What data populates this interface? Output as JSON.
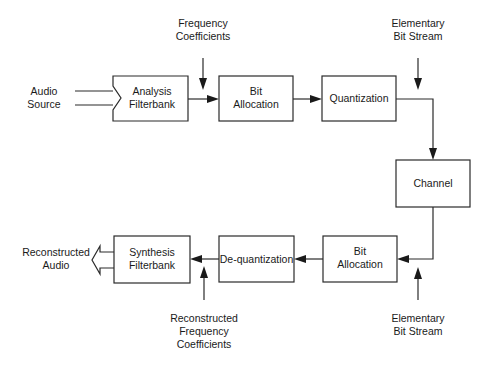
{
  "diagram": {
    "type": "block-diagram",
    "colors": {
      "stroke": "#2a2a2a",
      "text": "#1a1a1a",
      "background": "#ffffff"
    },
    "input_label": [
      "Audio",
      "Source"
    ],
    "output_label": [
      "Reconstructed",
      "Audio"
    ],
    "top_row": {
      "analysis": [
        "Analysis",
        "Filterbank"
      ],
      "bit_allocation": [
        "Bit",
        "Allocation"
      ],
      "quantization": "Quantization"
    },
    "channel": "Channel",
    "bottom_row": {
      "bit_allocation": [
        "Bit",
        "Allocation"
      ],
      "dequantization": "De-quantization",
      "synthesis": [
        "Synthesis",
        "Filterbank"
      ]
    },
    "side_inputs": {
      "frequency_coefficients": [
        "Frequency",
        "Coefficients"
      ],
      "elementary_bit_stream_top": [
        "Elementary",
        "Bit Stream"
      ],
      "elementary_bit_stream_bottom": [
        "Elementary",
        "Bit Stream"
      ],
      "reconstructed_frequency_coefficients": [
        "Reconstructed",
        "Frequency",
        "Coefficients"
      ]
    },
    "edges": [
      [
        "Audio Source",
        "Analysis Filterbank"
      ],
      [
        "Analysis Filterbank",
        "Bit Allocation"
      ],
      [
        "Frequency Coefficients",
        "Bit Allocation"
      ],
      [
        "Bit Allocation",
        "Quantization"
      ],
      [
        "Elementary Bit Stream",
        "Quantization"
      ],
      [
        "Quantization",
        "Channel"
      ],
      [
        "Channel",
        "Bit Allocation (decoder)"
      ],
      [
        "Elementary Bit Stream",
        "Bit Allocation (decoder)"
      ],
      [
        "Bit Allocation (decoder)",
        "De-quantization"
      ],
      [
        "De-quantization",
        "Synthesis Filterbank"
      ],
      [
        "Reconstructed Frequency Coefficients",
        "Synthesis Filterbank"
      ],
      [
        "Synthesis Filterbank",
        "Reconstructed Audio"
      ]
    ]
  }
}
